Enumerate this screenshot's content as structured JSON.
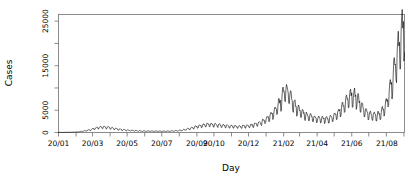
{
  "chart_data": {
    "type": "line",
    "title": "",
    "subtitle": "",
    "xlabel": "Day",
    "ylabel": "Cases",
    "grid": false,
    "legend": null,
    "xlim": [
      0,
      610
    ],
    "ylim": [
      0,
      26500
    ],
    "y_ticks_major": [
      0,
      5000,
      15000,
      25000
    ],
    "y_ticks_minor": [
      10000,
      20000
    ],
    "y_tick_labels": [
      "0",
      "5000",
      "15000",
      "25000"
    ],
    "x_tick_labels": [
      "20/01",
      "20/03",
      "20/05",
      "20/07",
      "20/09",
      "20/10",
      "20/12",
      "21/02",
      "21/04",
      "21/06",
      "21/08"
    ],
    "x_tick_label_positions": [
      0,
      60,
      121,
      182,
      244,
      274,
      335,
      397,
      456,
      517,
      579
    ],
    "x_minor_tick_positions": [
      0,
      31,
      60,
      91,
      121,
      152,
      182,
      213,
      244,
      274,
      305,
      335,
      366,
      397,
      425,
      456,
      486,
      517,
      547,
      578,
      609
    ],
    "line_color": "#000000",
    "line_width": 0.6,
    "series": [
      {
        "name": "Daily cases",
        "x": [
          0,
          7,
          14,
          21,
          28,
          35,
          42,
          49,
          56,
          63,
          70,
          77,
          84,
          91,
          98,
          105,
          112,
          119,
          126,
          133,
          140,
          147,
          154,
          161,
          168,
          175,
          182,
          189,
          196,
          203,
          210,
          217,
          224,
          231,
          238,
          245,
          252,
          259,
          266,
          273,
          280,
          287,
          294,
          301,
          308,
          315,
          322,
          329,
          336,
          343,
          350,
          357,
          364,
          371,
          378,
          385,
          392,
          399,
          406,
          413,
          420,
          427,
          434,
          441,
          448,
          455,
          462,
          469,
          476,
          483,
          490,
          497,
          504,
          511,
          518,
          525,
          532,
          539,
          546,
          553,
          560,
          567,
          574,
          581,
          588,
          595,
          602,
          609
        ],
        "values": [
          20,
          30,
          40,
          60,
          90,
          140,
          260,
          430,
          620,
          900,
          1100,
          1250,
          1200,
          1050,
          900,
          760,
          640,
          540,
          470,
          420,
          380,
          350,
          330,
          320,
          310,
          300,
          300,
          310,
          330,
          360,
          420,
          520,
          680,
          900,
          1150,
          1400,
          1600,
          1750,
          1820,
          1800,
          1720,
          1600,
          1500,
          1420,
          1380,
          1360,
          1380,
          1430,
          1520,
          1700,
          1950,
          2300,
          2800,
          3500,
          4400,
          5600,
          7200,
          9400,
          9000,
          7000,
          5600,
          4700,
          4100,
          3700,
          3400,
          3200,
          3100,
          3050,
          3100,
          3400,
          4000,
          5000,
          6400,
          7900,
          8600,
          8000,
          6400,
          5100,
          4300,
          3900,
          3800,
          4200,
          5400,
          7800,
          11500,
          16200,
          21500,
          24000
        ]
      }
    ],
    "peaks": [
      {
        "label": "wave-1",
        "x_approx": "20/03",
        "value": 1250
      },
      {
        "label": "wave-2",
        "x_approx": "20/12",
        "value": 9400
      },
      {
        "label": "wave-3",
        "x_approx": "21/04",
        "value": 8600
      },
      {
        "label": "wave-4",
        "x_approx": "21/08",
        "value": 25000
      }
    ]
  }
}
